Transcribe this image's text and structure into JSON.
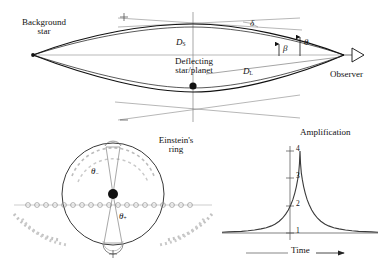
{
  "figure": {
    "title_hidden": "Gravitational microlensing geometry, Einstein ring, and light curve"
  },
  "top_panel": {
    "name": "lensing-geometry",
    "background_star_label_line1": "Background",
    "background_star_label_line2": "star",
    "deflecting_label_line1": "Deflecting",
    "deflecting_label_line2": "star/planet",
    "observer_label": "Observer",
    "eye_icon": "open-triangle-eye",
    "source_star_icon": "star-point",
    "lens_icon": "filled-dot",
    "distance_source": "D",
    "distance_source_sub": "S",
    "distance_lens": "D",
    "distance_lens_sub": "L",
    "angle_delta": "δ",
    "angle_beta": "β",
    "angle_theta": "θ",
    "plus_mark": "+",
    "minus_mark": "−"
  },
  "ring_panel": {
    "name": "einstein-ring",
    "title_line1": "Einstein's",
    "title_line2": "ring",
    "angle_theta_minus": "θ",
    "angle_theta_minus_sub": "−",
    "angle_theta_plus": "θ",
    "angle_theta_plus_sub": "+",
    "plus_mark": "+",
    "lens_icon": "filled-dot",
    "ring_icon": "circle-outline",
    "source_track_icon": "dotted-track"
  },
  "chart_data": {
    "type": "line",
    "name": "amplification-light-curve",
    "title": "Amplification",
    "xlabel": "Time",
    "ylabel": "",
    "x_axis_arrow": true,
    "grid": false,
    "legend": null,
    "ylim": [
      1,
      4.35
    ],
    "xlim": [
      -6,
      6
    ],
    "ytick_labels": [
      "1",
      "2",
      "3",
      "4"
    ],
    "ytick_values": [
      1,
      2,
      3,
      4
    ],
    "xtick_labels": [],
    "peak_value": 4,
    "baseline_value": 1,
    "x": [
      -6.0,
      -5.5,
      -5.0,
      -4.5,
      -4.0,
      -3.5,
      -3.0,
      -2.6,
      -2.2,
      -1.9,
      -1.6,
      -1.35,
      -1.1,
      -0.9,
      -0.7,
      -0.55,
      -0.4,
      -0.28,
      -0.18,
      -0.1,
      -0.04,
      0.0,
      0.04,
      0.1,
      0.18,
      0.28,
      0.4,
      0.55,
      0.7,
      0.9,
      1.1,
      1.35,
      1.6,
      1.9,
      2.2,
      2.6,
      3.0,
      3.5,
      4.0,
      4.5,
      5.0,
      5.5,
      6.0
    ],
    "values": [
      1.03,
      1.04,
      1.05,
      1.06,
      1.08,
      1.11,
      1.15,
      1.19,
      1.26,
      1.33,
      1.43,
      1.54,
      1.69,
      1.84,
      2.04,
      2.22,
      2.46,
      2.7,
      2.95,
      3.2,
      3.55,
      4.0,
      3.55,
      3.2,
      2.95,
      2.7,
      2.46,
      2.22,
      2.04,
      1.84,
      1.69,
      1.54,
      1.43,
      1.33,
      1.26,
      1.19,
      1.15,
      1.11,
      1.08,
      1.06,
      1.05,
      1.04,
      1.03
    ]
  },
  "colors": {
    "ink": "#111111",
    "thin_line": "#5a5a5a",
    "gray_arc": "#b9b9b9",
    "track": "#8c8c8c",
    "background": "#ffffff"
  }
}
